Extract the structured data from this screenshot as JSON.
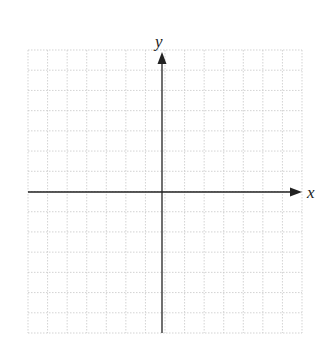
{
  "diagram": {
    "type": "cartesian-coordinate-grid",
    "axes": {
      "x_label": "x",
      "y_label": "y"
    },
    "grid": {
      "columns": 14,
      "rows": 14,
      "style": "dotted",
      "line_color": "#c8c8c8"
    },
    "colors": {
      "axis": "#222222",
      "background": "#ffffff"
    }
  }
}
